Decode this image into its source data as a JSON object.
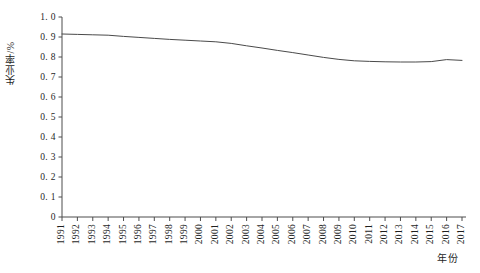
{
  "chart_data": {
    "type": "line",
    "title": "",
    "xlabel": "年份",
    "ylabel": "失业率/%",
    "x": [
      1991,
      1992,
      1993,
      1994,
      1995,
      1996,
      1997,
      1998,
      1999,
      2000,
      2001,
      2002,
      2003,
      2004,
      2005,
      2006,
      2007,
      2008,
      2009,
      2010,
      2011,
      2012,
      2013,
      2014,
      2015,
      2016,
      2017
    ],
    "categories": [
      "1991",
      "1992",
      "1993",
      "1994",
      "1995",
      "1996",
      "1997",
      "1998",
      "1999",
      "2000",
      "2001",
      "2002",
      "2003",
      "2004",
      "2005",
      "2006",
      "2007",
      "2008",
      "2009",
      "2010",
      "2011",
      "2012",
      "2013",
      "2014",
      "2015",
      "2016",
      "2017"
    ],
    "values": [
      0.915,
      0.913,
      0.911,
      0.909,
      0.903,
      0.898,
      0.893,
      0.888,
      0.884,
      0.88,
      0.876,
      0.868,
      0.856,
      0.845,
      0.833,
      0.822,
      0.81,
      0.798,
      0.788,
      0.781,
      0.778,
      0.776,
      0.775,
      0.775,
      0.777,
      0.787,
      0.783
    ],
    "series": [
      {
        "name": "失业率",
        "values": [
          0.915,
          0.913,
          0.911,
          0.909,
          0.903,
          0.898,
          0.893,
          0.888,
          0.884,
          0.88,
          0.876,
          0.868,
          0.856,
          0.845,
          0.833,
          0.822,
          0.81,
          0.798,
          0.788,
          0.781,
          0.778,
          0.776,
          0.775,
          0.775,
          0.777,
          0.787,
          0.783
        ],
        "color": "#4a4a4a"
      }
    ],
    "ylim": [
      0,
      1.0
    ],
    "ytick_labels": [
      "1. 0",
      "0. 9",
      "0. 8",
      "0. 7",
      "0. 6",
      "0. 5",
      "0. 4",
      "0. 3",
      "0. 2",
      "0. 1",
      "0"
    ],
    "ytick_values": [
      1.0,
      0.9,
      0.8,
      0.7,
      0.6,
      0.5,
      0.4,
      0.3,
      0.2,
      0.1,
      0.0
    ],
    "grid": false,
    "legend": "none",
    "line_color": "#4a4a4a",
    "axis_color": "#4d4d4d"
  }
}
